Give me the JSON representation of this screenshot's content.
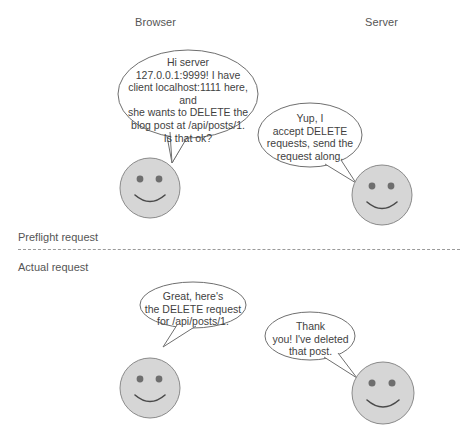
{
  "diagram": {
    "lanes": [
      {
        "id": "browser",
        "label": "Browser"
      },
      {
        "id": "server",
        "label": "Server"
      }
    ],
    "phases": [
      {
        "id": "preflight",
        "label": "Preflight request"
      },
      {
        "id": "actual",
        "label": "Actual request"
      }
    ],
    "messages": [
      {
        "id": "bubble-1",
        "from": "browser",
        "phase": "preflight",
        "text": "Hi server\n127.0.0.1:9999! I have\nclient localhost:1111 here, and\nshe wants to DELETE the\nblog post at /api/posts/1.\nIs that ok?"
      },
      {
        "id": "bubble-2",
        "from": "server",
        "phase": "preflight",
        "text": "Yup, I\naccept DELETE\nrequests, send the\nrequest along."
      },
      {
        "id": "bubble-3",
        "from": "browser",
        "phase": "actual",
        "text": "Great, here's\nthe DELETE request\nfor /api/posts/1."
      },
      {
        "id": "bubble-4",
        "from": "server",
        "phase": "actual",
        "text": "Thank\nyou! I've deleted\nthat post."
      }
    ],
    "actors": [
      {
        "id": "browser-face-preflight",
        "icon": "smiley-face-icon",
        "lane": "browser",
        "phase": "preflight"
      },
      {
        "id": "server-face-preflight",
        "icon": "smiley-face-icon",
        "lane": "server",
        "phase": "preflight"
      },
      {
        "id": "browser-face-actual",
        "icon": "smiley-face-icon",
        "lane": "browser",
        "phase": "actual"
      },
      {
        "id": "server-face-actual",
        "icon": "smiley-face-icon",
        "lane": "server",
        "phase": "actual"
      }
    ],
    "colors": {
      "background": "#ffffff",
      "face_fill": "#d6d6d6",
      "face_stroke": "#8a8a8a",
      "eye_fill": "#6e6e6e",
      "smile_stroke": "#4a4a4a",
      "bubble_stroke": "#6f6f6f",
      "bubble_fill": "#ffffff",
      "text": "#3f3f3f",
      "divider": "#9a9a9a"
    }
  }
}
